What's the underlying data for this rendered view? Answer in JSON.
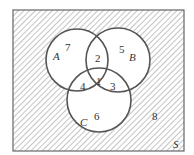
{
  "diagram": {
    "type": "venn",
    "universe_label": "S",
    "sets": [
      {
        "name": "A",
        "label": "A"
      },
      {
        "name": "B",
        "label": "B"
      },
      {
        "name": "C",
        "label": "C"
      }
    ],
    "regions": [
      {
        "id": "1",
        "label": "1",
        "description": "A ∩ B ∩ C"
      },
      {
        "id": "2",
        "label": "2",
        "description": "A ∩ B only"
      },
      {
        "id": "3",
        "label": "3",
        "description": "B ∩ C only"
      },
      {
        "id": "4",
        "label": "4",
        "description": "A ∩ C only"
      },
      {
        "id": "5",
        "label": "5",
        "description": "B only"
      },
      {
        "id": "6",
        "label": "6",
        "description": "C only"
      },
      {
        "id": "7",
        "label": "7",
        "description": "A only"
      },
      {
        "id": "8",
        "label": "8",
        "description": "outside A ∪ B ∪ C",
        "shaded": true
      }
    ],
    "colors": {
      "stroke": "#555555",
      "hatch": "#888888",
      "background": "#ffffff"
    }
  }
}
